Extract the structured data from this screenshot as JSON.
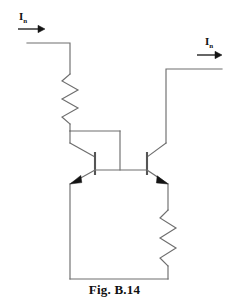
{
  "figure": {
    "caption": "Fig. B.14",
    "title": "Fig. B.14",
    "background_color": "#ffffff",
    "wire_color": "#6e6e6e",
    "ink_color": "#141414"
  },
  "labels": {
    "input_current": {
      "symbol": "I",
      "subscript": "n",
      "full": "In"
    },
    "output_current": {
      "symbol": "I",
      "subscript": "n",
      "full": "In"
    }
  },
  "circuit": {
    "type": "current-mirror",
    "components": [
      {
        "id": "r-bias",
        "kind": "resistor",
        "name": "left-bias-resistor",
        "orientation": "vertical"
      },
      {
        "id": "r-emitter",
        "kind": "resistor",
        "name": "right-emitter-resistor",
        "orientation": "vertical"
      },
      {
        "id": "q1",
        "kind": "transistor-npn",
        "name": "left-transistor",
        "config": "diode-connected"
      },
      {
        "id": "q2",
        "kind": "transistor-npn",
        "name": "right-transistor",
        "config": "mirror-output"
      },
      {
        "id": "rail-bottom",
        "kind": "wire",
        "name": "bottom-rail"
      },
      {
        "id": "wire-in",
        "kind": "wire",
        "name": "input-wire"
      },
      {
        "id": "wire-out",
        "kind": "wire",
        "name": "output-wire"
      }
    ]
  }
}
